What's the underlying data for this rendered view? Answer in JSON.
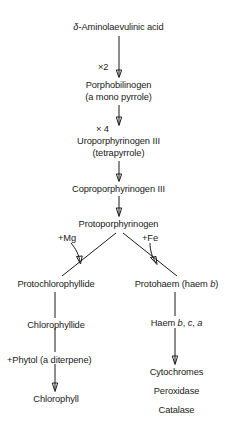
{
  "diagram": {
    "nodes": {
      "alaPrefix": "δ",
      "ala": "-Aminolaevulinic acid",
      "porphobilinogen": "Porphobilinogen",
      "porphobilinogen_sub": "(a mono pyrrole)",
      "uroporphyrinogen": "Uroporphyrinogen III",
      "uroporphyrinogen_sub": "(tetrapyrrole)",
      "coproporphyrinogen": "Coproporphyrinogen III",
      "protoporphyrinogen": "Protoporphyrinogen",
      "protochlorophyllide": "Protochlorophyllide",
      "chlorophyllide": "Chlorophyllide",
      "chlorophyll": "Chlorophyll",
      "protohaem_pre": "Protohaem (haem ",
      "protohaem_italic": "b",
      "protohaem_post": ")",
      "haem_pre": "Haem ",
      "haem_b": "b",
      "haem_sep1": ", ",
      "haem_c": "c",
      "haem_sep2": ", ",
      "haem_a": "a",
      "cytochromes": "Cytochromes",
      "peroxidase": "Peroxidase",
      "catalase": "Catalase"
    },
    "edge_labels": {
      "times2": "×2",
      "times4": "× 4",
      "plus_mg": "+Mg",
      "plus_fe": "+Fe",
      "plus_phytol": "+Phytol (a diterpene)"
    },
    "colors": {
      "ink": "#1a1a1a",
      "background": "#ffffff"
    }
  }
}
